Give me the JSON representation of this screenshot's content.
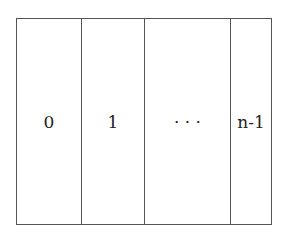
{
  "diagram": {
    "type": "array-slots",
    "cells": [
      {
        "label": "0"
      },
      {
        "label": "1"
      },
      {
        "label": "· · ·"
      },
      {
        "label": "n-1"
      }
    ],
    "colors": {
      "border": "#555555",
      "text": "#222222",
      "background": "#ffffff"
    }
  }
}
